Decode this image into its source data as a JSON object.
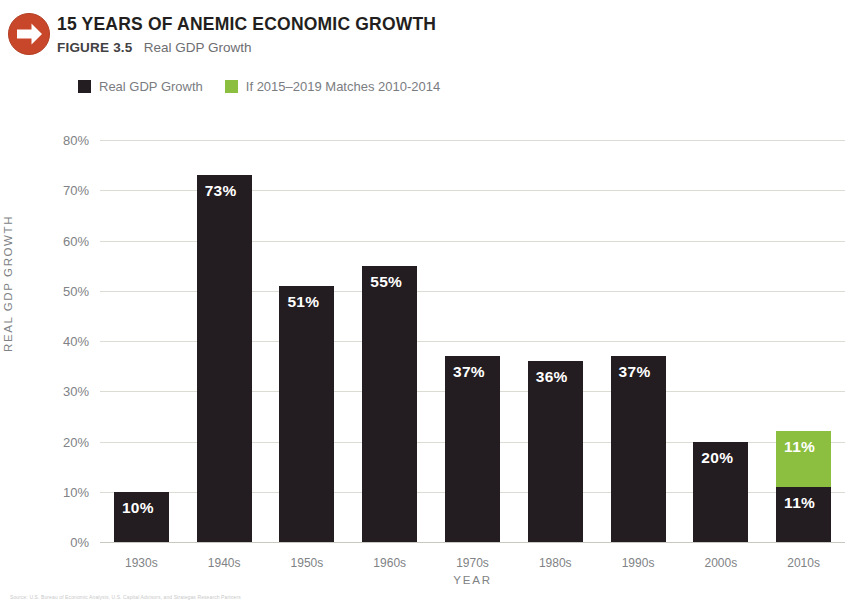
{
  "header": {
    "icon": "right-arrow-circle-icon",
    "icon_color": "#c8472a",
    "title": "15 YEARS OF ANEMIC ECONOMIC GROWTH",
    "figure_label": "FIGURE 3.5",
    "figure_subtitle": "Real GDP Growth"
  },
  "legend": {
    "items": [
      {
        "label": "Real GDP Growth",
        "color": "#231c20",
        "swatch": "dark-square-swatch"
      },
      {
        "label": "If 2015–2019 Matches 2010-2014",
        "color": "#8cbf3f",
        "swatch": "green-square-swatch"
      }
    ]
  },
  "axes": {
    "ylabel": "REAL GDP GROWTH",
    "xlabel": "YEAR",
    "yticks": [
      "80%",
      "70%",
      "60%",
      "50%",
      "40%",
      "30%",
      "20%",
      "10%",
      "0%"
    ]
  },
  "source_caption": "Source: U.S. Bureau of Economic Analysis, U.S. Capital Advisors, and Strategas Research Partners",
  "chart_data": {
    "type": "bar",
    "title": "15 YEARS OF ANEMIC ECONOMIC GROWTH",
    "subtitle": "FIGURE 3.5 Real GDP Growth",
    "xlabel": "YEAR",
    "ylabel": "REAL GDP GROWTH",
    "ylim": [
      0,
      80
    ],
    "ytick_values": [
      80,
      70,
      60,
      50,
      40,
      30,
      20,
      10,
      0
    ],
    "grid": true,
    "legend_position": "top-left",
    "stacked": true,
    "categories": [
      "1930s",
      "1940s",
      "1950s",
      "1960s",
      "1970s",
      "1980s",
      "1990s",
      "2000s",
      "2010s"
    ],
    "series": [
      {
        "name": "Real GDP Growth",
        "color": "#231c20",
        "values": [
          10,
          73,
          51,
          55,
          37,
          36,
          37,
          20,
          11
        ],
        "labels": [
          "10%",
          "73%",
          "51%",
          "55%",
          "37%",
          "36%",
          "37%",
          "20%",
          "11%"
        ]
      },
      {
        "name": "If 2015–2019 Matches 2010-2014",
        "color": "#8cbf3f",
        "values": [
          0,
          0,
          0,
          0,
          0,
          0,
          0,
          0,
          11
        ],
        "labels": [
          "",
          "",
          "",
          "",
          "",
          "",
          "",
          "",
          "11%"
        ]
      }
    ]
  }
}
